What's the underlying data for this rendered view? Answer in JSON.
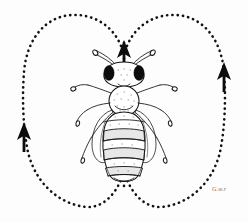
{
  "figure": {
    "title": "Honeybee waggle dance figure-eight pattern",
    "subject": "honeybee",
    "background_color": "#fdfdfd",
    "ink_color": "#111111",
    "width": 248,
    "height": 222
  },
  "dance_path": {
    "name": "figure-eight waggle dance circuit",
    "style": "dotted",
    "dot_color": "#111111",
    "left_loop_label": "left return loop",
    "right_loop_label": "right return loop",
    "waggle_run_label": "central waggle run"
  },
  "arrows": [
    {
      "id": "waggle-run-arrow",
      "label": "waggle run direction",
      "direction": "up",
      "position": "center-top"
    },
    {
      "id": "left-loop-arrow",
      "label": "left loop direction",
      "direction": "down",
      "position": "left-middle"
    },
    {
      "id": "right-loop-arrow",
      "label": "right loop direction",
      "direction": "down",
      "position": "right-upper"
    }
  ],
  "bee": {
    "label": "honeybee worker, dorsal view",
    "parts": [
      {
        "id": "antennae",
        "label": "antennae"
      },
      {
        "id": "compound-eyes",
        "label": "compound eyes"
      },
      {
        "id": "head",
        "label": "head"
      },
      {
        "id": "thorax",
        "label": "thorax"
      },
      {
        "id": "abdomen",
        "label": "abdomen with bands"
      },
      {
        "id": "forewings",
        "label": "forewings"
      },
      {
        "id": "legs",
        "label": "six legs"
      }
    ]
  },
  "signature": {
    "text": "G.w.r",
    "color": "#6f6f6f"
  }
}
